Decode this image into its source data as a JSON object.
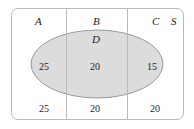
{
  "diagram": {
    "type": "venn-set-diagram",
    "universe_label": "S",
    "ellipse_label": "D",
    "colors": {
      "ellipse_fill": "#dcdcdc",
      "ellipse_stroke": "#9a9a9c",
      "box_stroke": "#b9b9bb",
      "divider_stroke": "#b9b9bb",
      "text": "#1d1d1f",
      "background": "#ffffff"
    },
    "set_labels": {
      "a": "A",
      "b": "B",
      "c": "C",
      "d": "D",
      "s": "S"
    },
    "counts": {
      "inside_ellipse": {
        "a": "25",
        "b": "20",
        "c": "15"
      },
      "outside_ellipse": {
        "a": "25",
        "b": "20",
        "c": "20"
      }
    }
  }
}
